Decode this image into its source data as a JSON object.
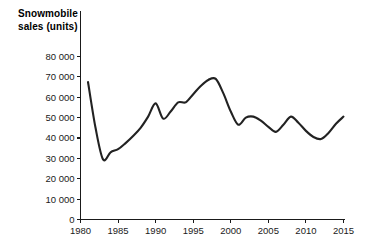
{
  "chart_data": {
    "type": "line",
    "title": "Snowmobile sales (units)",
    "title_line1": "Snowmobile",
    "title_line2": "sales (units)",
    "xlabel": "",
    "ylabel": "",
    "xlim": [
      1980,
      2015
    ],
    "ylim": [
      0,
      80000
    ],
    "grid": false,
    "legend": "none",
    "line_color": "#222222",
    "background_color": "#ffffff",
    "axis_color": "#1a1a1a",
    "y_tick_labels": [
      "0",
      "10 000",
      "20 000",
      "30 000",
      "40 000",
      "50 000",
      "60 000",
      "70 000",
      "80 000"
    ],
    "y_tick_values": [
      0,
      10000,
      20000,
      30000,
      40000,
      50000,
      60000,
      70000,
      80000
    ],
    "x_tick_labels": [
      "1980",
      "1985",
      "1990",
      "1995",
      "2000",
      "2005",
      "2010",
      "2015"
    ],
    "x_tick_values": [
      1980,
      1985,
      1990,
      1995,
      2000,
      2005,
      2010,
      2015
    ],
    "series": [
      {
        "name": "Snowmobile sales",
        "x": [
          1981,
          1982,
          1983,
          1984,
          1985,
          1986,
          1987,
          1988,
          1989,
          1990,
          1991,
          1992,
          1993,
          1994,
          1995,
          1996,
          1997,
          1998,
          1999,
          2000,
          2001,
          2002,
          2003,
          2004,
          2005,
          2006,
          2007,
          2008,
          2009,
          2010,
          2011,
          2012,
          2013,
          2014,
          2015
        ],
        "values": [
          67500,
          45000,
          29500,
          33000,
          34500,
          37500,
          41000,
          45000,
          50500,
          57000,
          49500,
          53000,
          57500,
          57500,
          61500,
          65500,
          68500,
          69000,
          62000,
          53000,
          46500,
          50000,
          50500,
          48500,
          45500,
          43000,
          46500,
          50500,
          47500,
          43500,
          40500,
          39500,
          42500,
          47000,
          50500
        ]
      }
    ]
  }
}
